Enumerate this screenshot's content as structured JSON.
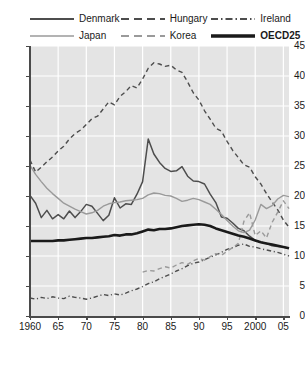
{
  "chart_data": {
    "type": "line",
    "title": "",
    "xlabel": "",
    "ylabel": "",
    "xlim": [
      1960,
      2006
    ],
    "ylim": [
      0,
      45
    ],
    "yticks": [
      0,
      5,
      10,
      15,
      20,
      25,
      30,
      35,
      40,
      45
    ],
    "ytick_labels": [
      "0",
      "5",
      "10",
      "15",
      "20",
      "25",
      "30",
      "35",
      "40",
      "45"
    ],
    "xticks": [
      1960,
      1965,
      1970,
      1975,
      1980,
      1985,
      1990,
      1995,
      2000,
      2005
    ],
    "xtick_labels": [
      "1960",
      "65",
      "70",
      "75",
      "80",
      "85",
      "90",
      "95",
      "2000",
      "05"
    ],
    "grid": true,
    "grid_color": "#ffffff",
    "plot_background": "#e4e4e4",
    "legend_position": "top",
    "series": [
      {
        "name": "Denmark",
        "style": "solid",
        "color": "#4d4d4d",
        "width": 1.5,
        "x": [
          1960,
          1961,
          1962,
          1963,
          1964,
          1965,
          1966,
          1967,
          1968,
          1969,
          1970,
          1971,
          1972,
          1973,
          1974,
          1975,
          1976,
          1977,
          1978,
          1979,
          1980,
          1981,
          1982,
          1983,
          1984,
          1985,
          1986,
          1987,
          1988,
          1989,
          1990,
          1991,
          1992,
          1993,
          1994,
          1995,
          1996,
          1997,
          1998,
          1999,
          2000,
          2001,
          2002,
          2003,
          2004,
          2005,
          2006
        ],
        "y": [
          20.1,
          18.8,
          16.4,
          17.6,
          16.2,
          16.9,
          16.2,
          17.5,
          16.4,
          17.4,
          18.6,
          18.3,
          17.1,
          15.9,
          16.8,
          19.7,
          18.0,
          18.7,
          18.6,
          20.3,
          22.4,
          29.5,
          27.0,
          25.6,
          24.6,
          24.1,
          24.2,
          24.9,
          23.3,
          22.5,
          22.4,
          22.0,
          20.3,
          18.9,
          16.5,
          16.3,
          15.5,
          14.6,
          14.2,
          13.3,
          12.6,
          12.3,
          12.1,
          11.7,
          11.6,
          11.5,
          11.3
        ]
      },
      {
        "name": "Hungary",
        "style": "dashed",
        "color": "#4d4d4d",
        "width": 1.4,
        "x": [
          1960,
          1961,
          1962,
          1963,
          1964,
          1965,
          1966,
          1967,
          1968,
          1969,
          1970,
          1971,
          1972,
          1973,
          1974,
          1975,
          1976,
          1977,
          1978,
          1979,
          1980,
          1981,
          1982,
          1983,
          1984,
          1985,
          1986,
          1987,
          1988,
          1989,
          1990,
          1991,
          1992,
          1993,
          1994,
          1995,
          1996,
          1997,
          1998,
          1999,
          2000,
          2001,
          2002,
          2003,
          2004,
          2005,
          2006
        ],
        "y": [
          26.0,
          24.0,
          24.8,
          25.7,
          26.5,
          27.5,
          28.3,
          29.5,
          30.4,
          31.0,
          31.9,
          32.9,
          33.3,
          34.5,
          35.7,
          35.2,
          36.6,
          37.4,
          38.4,
          38.0,
          39.5,
          41.3,
          42.2,
          42.0,
          41.6,
          41.8,
          41.0,
          40.6,
          39.0,
          37.2,
          36.0,
          34.2,
          32.8,
          31.3,
          30.8,
          29.1,
          27.6,
          26.4,
          25.2,
          24.8,
          23.2,
          22.0,
          20.4,
          19.0,
          17.7,
          16.0,
          14.8
        ]
      },
      {
        "name": "Ireland",
        "style": "dashdot",
        "color": "#4d4d4d",
        "width": 1.4,
        "x": [
          1960,
          1961,
          1962,
          1963,
          1964,
          1965,
          1966,
          1967,
          1968,
          1969,
          1970,
          1971,
          1972,
          1973,
          1974,
          1975,
          1976,
          1977,
          1978,
          1979,
          1980,
          1981,
          1982,
          1983,
          1984,
          1985,
          1986,
          1987,
          1988,
          1989,
          1990,
          1991,
          1992,
          1993,
          1994,
          1995,
          1996,
          1997,
          1998,
          1999,
          2000,
          2001,
          2002,
          2003,
          2004,
          2005,
          2006
        ],
        "y": [
          3.0,
          2.8,
          3.1,
          2.9,
          3.2,
          3.0,
          2.9,
          3.3,
          3.1,
          3.0,
          2.8,
          3.0,
          3.3,
          3.6,
          3.4,
          3.7,
          3.5,
          3.8,
          4.2,
          4.5,
          4.9,
          5.4,
          5.7,
          6.2,
          6.6,
          7.0,
          7.5,
          7.9,
          8.4,
          8.8,
          9.0,
          9.4,
          9.8,
          10.2,
          10.6,
          11.1,
          11.4,
          11.8,
          12.0,
          11.6,
          11.5,
          11.2,
          11.0,
          10.8,
          10.6,
          10.3,
          10.0
        ]
      },
      {
        "name": "Japan",
        "style": "solid",
        "color": "#9a9a9a",
        "width": 1.4,
        "x": [
          1960,
          1961,
          1962,
          1963,
          1964,
          1965,
          1966,
          1967,
          1968,
          1969,
          1970,
          1971,
          1972,
          1973,
          1974,
          1975,
          1976,
          1977,
          1978,
          1979,
          1980,
          1981,
          1982,
          1983,
          1984,
          1985,
          1986,
          1987,
          1988,
          1989,
          1990,
          1991,
          1992,
          1993,
          1994,
          1995,
          1996,
          1997,
          1998,
          1999,
          2000,
          2001,
          2002,
          2003,
          2004,
          2005,
          2006
        ],
        "y": [
          25.1,
          23.6,
          22.4,
          21.3,
          20.4,
          19.6,
          18.8,
          18.3,
          17.8,
          17.4,
          17.0,
          17.2,
          17.6,
          18.3,
          18.7,
          18.9,
          19.0,
          19.2,
          19.3,
          19.4,
          19.6,
          20.2,
          20.5,
          20.4,
          20.1,
          20.0,
          19.6,
          19.1,
          19.3,
          19.6,
          19.4,
          19.0,
          18.6,
          17.8,
          16.9,
          15.9,
          15.0,
          14.2,
          13.9,
          14.3,
          16.0,
          18.6,
          17.9,
          18.4,
          19.5,
          20.1,
          19.9
        ]
      },
      {
        "name": "Korea",
        "style": "dashed",
        "color": "#9a9a9a",
        "width": 1.4,
        "x": [
          1980,
          1981,
          1982,
          1983,
          1984,
          1985,
          1986,
          1987,
          1988,
          1989,
          1990,
          1991,
          1992,
          1993,
          1994,
          1995,
          1996,
          1997,
          1998,
          1999,
          2000,
          2001,
          2002,
          2003,
          2004,
          2005,
          2006
        ],
        "y": [
          7.3,
          7.6,
          7.5,
          7.9,
          8.2,
          8.0,
          8.5,
          8.9,
          8.6,
          9.2,
          9.6,
          9.3,
          9.9,
          10.4,
          10.1,
          10.8,
          11.4,
          12.1,
          15.8,
          17.2,
          13.4,
          14.2,
          13.0,
          15.6,
          17.3,
          19.2,
          17.9
        ]
      },
      {
        "name": "OECD25",
        "style": "solid",
        "color": "#1a1a1a",
        "width": 2.6,
        "x": [
          1960,
          1961,
          1962,
          1963,
          1964,
          1965,
          1966,
          1967,
          1968,
          1969,
          1970,
          1971,
          1972,
          1973,
          1974,
          1975,
          1976,
          1977,
          1978,
          1979,
          1980,
          1981,
          1982,
          1983,
          1984,
          1985,
          1986,
          1987,
          1988,
          1989,
          1990,
          1991,
          1992,
          1993,
          1994,
          1995,
          1996,
          1997,
          1998,
          1999,
          2000,
          2001,
          2002,
          2003,
          2004,
          2005,
          2006
        ],
        "y": [
          12.5,
          12.5,
          12.5,
          12.5,
          12.5,
          12.6,
          12.6,
          12.7,
          12.8,
          12.9,
          13.0,
          13.0,
          13.1,
          13.2,
          13.3,
          13.5,
          13.4,
          13.6,
          13.6,
          13.8,
          14.1,
          14.4,
          14.3,
          14.5,
          14.5,
          14.6,
          14.8,
          15.0,
          15.1,
          15.2,
          15.3,
          15.2,
          15.0,
          14.6,
          14.3,
          14.0,
          13.7,
          13.4,
          13.2,
          12.9,
          12.6,
          12.3,
          12.1,
          11.9,
          11.7,
          11.5,
          11.3
        ]
      }
    ]
  },
  "legend": {
    "items": [
      {
        "label": "Denmark",
        "icon": "solid-line-swatch",
        "bold": false
      },
      {
        "label": "Hungary",
        "icon": "dashed-line-swatch",
        "bold": false
      },
      {
        "label": "Ireland",
        "icon": "dashdot-line-swatch",
        "bold": false
      },
      {
        "label": "Japan",
        "icon": "solid-line-swatch",
        "bold": false
      },
      {
        "label": "Korea",
        "icon": "dashed-line-swatch",
        "bold": false
      },
      {
        "label": "OECD25",
        "icon": "thick-solid-line-swatch",
        "bold": true
      }
    ]
  }
}
